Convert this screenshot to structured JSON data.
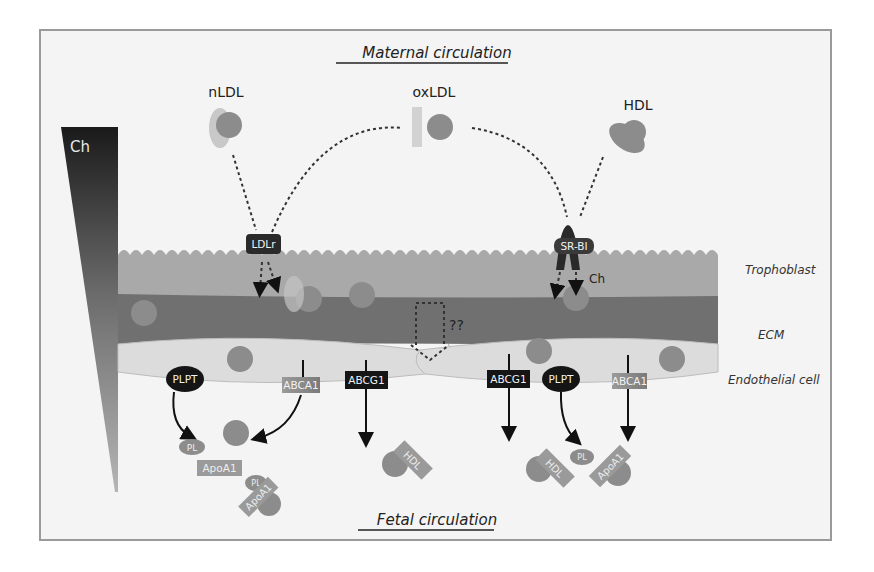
{
  "titles": {
    "top": "Maternal circulation",
    "bottom": "Fetal circulation"
  },
  "gradient": {
    "label": "Ch",
    "color_top": "#1a1a1a",
    "color_bottom": "#b0b0b0"
  },
  "lipoproteins": {
    "nldl": "nLDL",
    "oxldl": "oxLDL",
    "hdl": "HDL"
  },
  "receptors": {
    "ldlr": "LDLr",
    "srbi": "SR-BI",
    "srbi_ch": "Ch",
    "unknown": "??"
  },
  "layers": {
    "trophoblast": "Trophoblast",
    "ecm": "ECM",
    "endothelial": "Endothelial cell"
  },
  "transporters": {
    "left": [
      {
        "label": "PLPT",
        "shape": "ellipse"
      },
      {
        "label": "ABCA1",
        "shape": "rect-gray"
      },
      {
        "label": "ABCG1",
        "shape": "rect-black"
      }
    ],
    "right": [
      {
        "label": "ABCG1",
        "shape": "rect-black"
      },
      {
        "label": "PLPT",
        "shape": "ellipse"
      },
      {
        "label": "ABCA1",
        "shape": "rect-gray"
      }
    ]
  },
  "products": {
    "pl": "PL",
    "apoa1": "ApoA1",
    "hdl": "HDL"
  },
  "colors": {
    "frame_bg": "#f4f4f4",
    "trophoblast": "#a9a9a9",
    "ecm": "#707070",
    "endothelial": "#dcdcdc",
    "ch_particle": "#8c8c8c",
    "dark_label": "#1c1c1c",
    "gray_label": "#8a8a8a"
  }
}
